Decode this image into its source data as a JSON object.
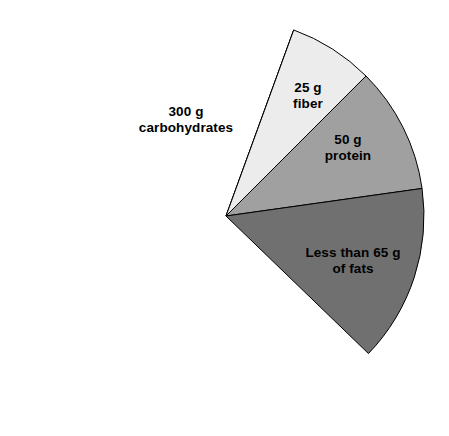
{
  "chart_data": {
    "type": "pie",
    "title": "",
    "subtitle": "",
    "xlabel": "",
    "ylabel": "",
    "legend_position": "none",
    "grid": false,
    "units": "g",
    "categories": [
      "carbohydrates",
      "fiber",
      "protein",
      "fats"
    ],
    "values": [
      300,
      25,
      50,
      65
    ],
    "labels": [
      "300 g\ncarbohydrates",
      "25 g\nfiber",
      "50 g\nprotein",
      "Less than 65 g\nof fats"
    ],
    "colors": [
      "#333333",
      "#ececec",
      "#a0a0a0",
      "#707070"
    ],
    "slices": [
      {
        "name": "carbohydrates",
        "amount": 300,
        "unit": "g",
        "label_line1": "300 g",
        "label_line2": "carbohydrates",
        "color": "#333333",
        "start_angle": -70,
        "end_angle": 290,
        "label_x": 186,
        "label_y": 112
      },
      {
        "name": "fiber",
        "amount": 25,
        "unit": "g",
        "label_line1": "25 g",
        "label_line2": "fiber",
        "color": "#ececec",
        "start_angle": -70,
        "end_angle": -45,
        "label_x": 308,
        "label_y": 88
      },
      {
        "name": "protein",
        "amount": 50,
        "unit": "g",
        "label_line1": "50 g",
        "label_line2": "protein",
        "color": "#a0a0a0",
        "start_angle": -45,
        "end_angle": -8,
        "label_x": 348,
        "label_y": 140
      },
      {
        "name": "fats",
        "amount": 65,
        "unit": "g",
        "label_line1": "Less than 65 g",
        "label_line2": "of fats",
        "color": "#707070",
        "start_angle": -8,
        "end_angle": 44,
        "label_x": 353,
        "label_y": 253
      }
    ],
    "geometry": {
      "center_x": 226,
      "center_y": 216,
      "radius": 198
    },
    "background_color": "#ffffff"
  }
}
